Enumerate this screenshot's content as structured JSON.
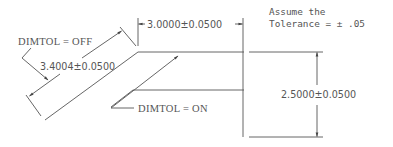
{
  "drawing": {
    "title": "DIMTOL dimension tolerance illustration",
    "labels": {
      "dimtol_off": "DIMTOL  =  OFF",
      "dimtol_on": "DIMTOL  =  ON",
      "dim_diagonal": "3.4004±0.0500",
      "dim_horizontal": "3.0000±0.0500",
      "dim_vertical": "2.5000±0.0500",
      "note_line1": "Assume the",
      "note_line2": "Tolerance  =  ±  .05"
    },
    "colors": {
      "line": "#555555",
      "background": "#ffffff"
    }
  }
}
